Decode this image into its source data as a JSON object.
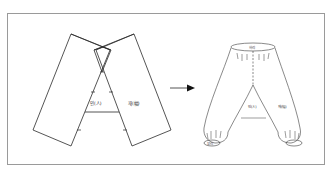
{
  "figure": {
    "pattern_labels": {
      "gusset": "인(人)",
      "panel": "재(幅)"
    },
    "garment_labels": {
      "waistband": "허리",
      "gusset": "인(人)",
      "panel": "재(幅)",
      "cuff": "부리"
    },
    "arrow": "→",
    "colors": {
      "line": "#2a2a2a",
      "frame": "#9a9a9a",
      "background": "#ffffff"
    }
  }
}
